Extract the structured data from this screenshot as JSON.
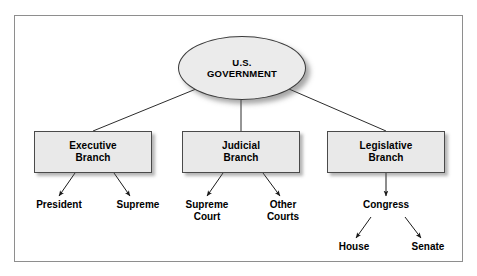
{
  "diagram": {
    "type": "hierarchy-tree",
    "frame_border_color": "#8e8e8e",
    "node_fill_color": "#e9e9e9",
    "node_border_color": "#4a4a4a",
    "text_color": "#000000",
    "background_color": "#ffffff"
  },
  "root": {
    "line1": "U.S.",
    "line2": "GOVERNMENT"
  },
  "branches": [
    {
      "line1": "Executive",
      "line2": "Branch",
      "children": [
        {
          "line1": "President",
          "line2": ""
        },
        {
          "line1": "Cabinet",
          "line2": ""
        }
      ]
    },
    {
      "line1": "Judicial",
      "line2": "Branch",
      "children": [
        {
          "line1": "Supreme",
          "line2": "Court"
        },
        {
          "line1": "Other",
          "line2": "Courts"
        }
      ]
    },
    {
      "line1": "Legislative",
      "line2": "Branch",
      "children": [
        {
          "line1": "Congress",
          "line2": ""
        }
      ]
    }
  ],
  "congress_children": [
    {
      "line1": "House",
      "line2": ""
    },
    {
      "line1": "Senate",
      "line2": ""
    }
  ]
}
